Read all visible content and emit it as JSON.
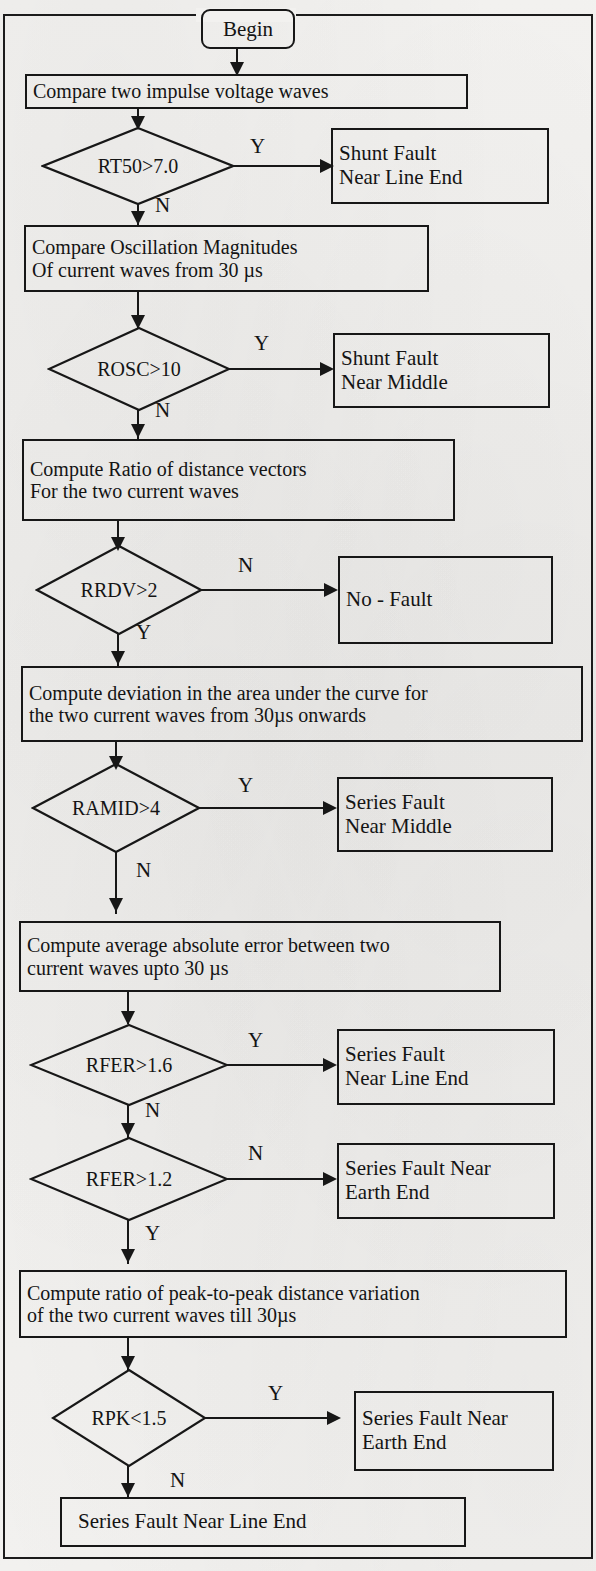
{
  "figure": {
    "type": "flowchart",
    "colors": {
      "ink": "#171717",
      "paper": "#f2f1ef"
    }
  },
  "terminator": {
    "label": "Begin"
  },
  "process": {
    "p1": {
      "lines": [
        "Compare two impulse voltage waves"
      ]
    },
    "p2": {
      "lines": [
        "Compare Oscillation Magnitudes",
        "Of current waves from 30 µs"
      ]
    },
    "p3": {
      "lines": [
        "Compute Ratio of distance vectors",
        "For the two current waves"
      ]
    },
    "p4": {
      "lines": [
        "Compute deviation in the area under the curve for",
        "the two current waves from 30µs onwards"
      ]
    },
    "p5": {
      "lines": [
        "Compute average absolute error between two",
        "current waves upto 30 µs"
      ]
    },
    "p6": {
      "lines": [
        "Compute ratio of  peak-to-peak distance variation",
        "of the two current waves till 30µs"
      ]
    }
  },
  "decisions": {
    "d1": {
      "label": "RT50>7.0",
      "yes_branch": "Y",
      "no_branch": "N"
    },
    "d2": {
      "label": "ROSC>10",
      "yes_branch": "Y",
      "no_branch": "N"
    },
    "d3": {
      "label": "RRDV>2",
      "yes_branch": "Y",
      "no_branch": "N"
    },
    "d4": {
      "label": "RAMID>4",
      "yes_branch": "Y",
      "no_branch": "N"
    },
    "d5": {
      "label": "RFER>1.6",
      "yes_branch": "Y",
      "no_branch": "N"
    },
    "d6": {
      "label": "RFER>1.2",
      "yes_branch": "Y",
      "no_branch": "N"
    },
    "d7": {
      "label": "RPK<1.5",
      "yes_branch": "Y",
      "no_branch": "N"
    }
  },
  "outcomes": {
    "o1": {
      "lines": [
        "Shunt Fault",
        "Near Line End"
      ]
    },
    "o2": {
      "lines": [
        "Shunt Fault",
        "Near Middle"
      ]
    },
    "o3": {
      "lines": [
        "No - Fault"
      ]
    },
    "o4": {
      "lines": [
        "Series Fault",
        "Near Middle"
      ]
    },
    "o5": {
      "lines": [
        "Series Fault",
        "Near Line End"
      ]
    },
    "o6": {
      "lines": [
        "Series Fault Near",
        "Earth End"
      ]
    },
    "o7": {
      "lines": [
        "Series Fault Near",
        "Earth End"
      ]
    },
    "o8": {
      "lines": [
        "Series Fault Near Line End"
      ]
    }
  }
}
